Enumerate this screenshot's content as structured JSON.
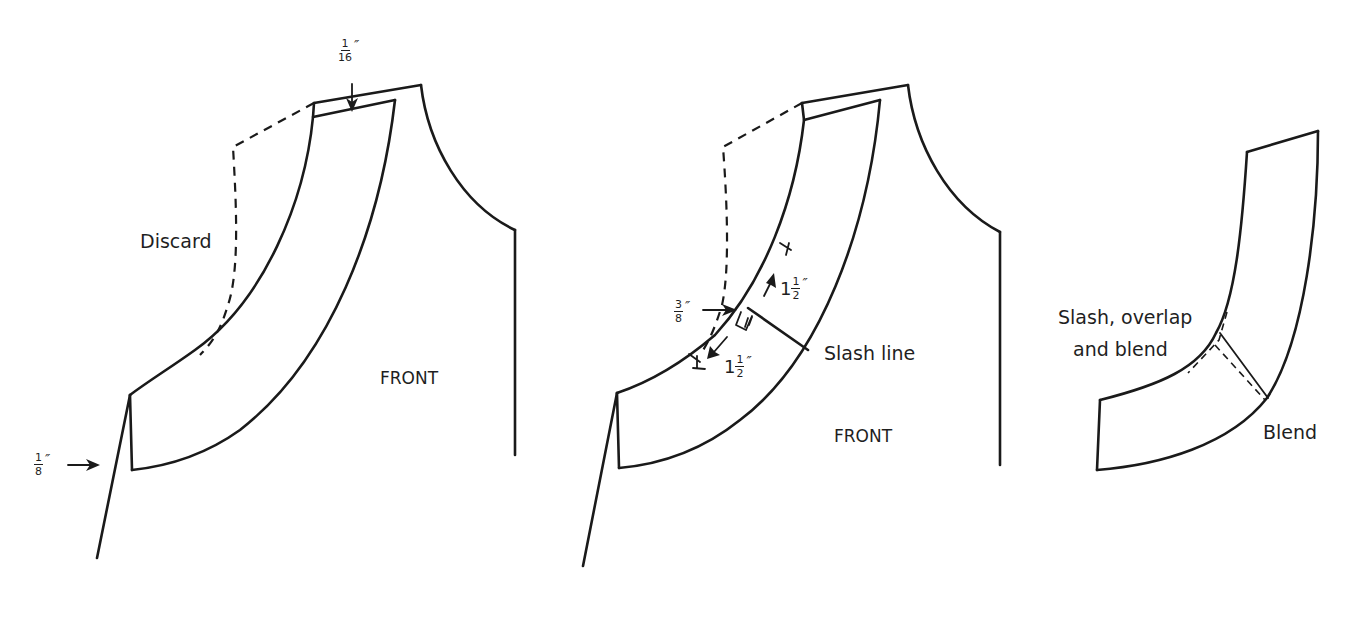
{
  "figures": [
    {
      "id": "step-1",
      "labels": {
        "discard": "Discard",
        "front": "FRONT"
      },
      "measurements": [
        {
          "id": "shoulder-offset",
          "whole": "",
          "numerator": "1",
          "denominator": "16",
          "unit": "″"
        },
        {
          "id": "center-front-offset",
          "whole": "",
          "numerator": "1",
          "denominator": "8",
          "unit": "″"
        }
      ]
    },
    {
      "id": "step-2",
      "labels": {
        "slash_line": "Slash line",
        "front": "FRONT"
      },
      "measurements": [
        {
          "id": "overlap-amount",
          "whole": "",
          "numerator": "3",
          "denominator": "8",
          "unit": "″"
        },
        {
          "id": "upper-distance",
          "whole": "1",
          "numerator": "1",
          "denominator": "2",
          "unit": "″"
        },
        {
          "id": "lower-distance",
          "whole": "1",
          "numerator": "1",
          "denominator": "2",
          "unit": "″"
        }
      ]
    },
    {
      "id": "step-3",
      "labels": {
        "slash_overlap_line1": "Slash, overlap",
        "slash_overlap_line2": "and blend",
        "blend": "Blend"
      }
    }
  ],
  "colors": {
    "line": "#1a1a1a",
    "background": "#ffffff"
  }
}
